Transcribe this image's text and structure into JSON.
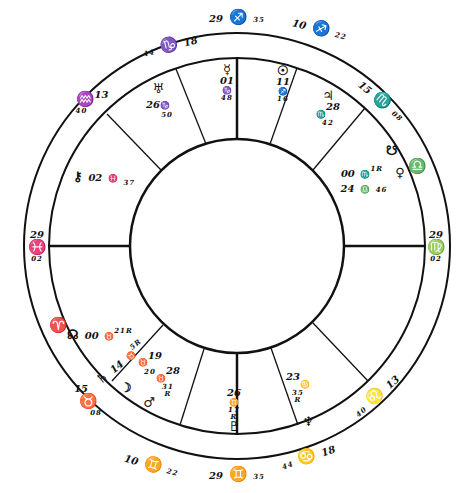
{
  "chart": {
    "type": "natal-wheel",
    "geometry": {
      "cx": 237,
      "cy": 246,
      "outer_r": 213,
      "ring_r": 188,
      "inner_r": 107
    },
    "colors": {
      "line": "#111111",
      "background": "#ffffff"
    }
  },
  "cusps": [
    {
      "id": "mc",
      "deg": "29",
      "sign": "♐",
      "min": "35",
      "x": 237,
      "y": 18
    },
    {
      "id": "c11",
      "deg": "10",
      "sign": "♐",
      "min": "22",
      "x": 322,
      "y": 30
    },
    {
      "id": "c12",
      "deg": "15",
      "sign": "♏",
      "min": "08",
      "x": 386,
      "y": 100
    },
    {
      "id": "asc_desc_right",
      "deg": "29",
      "sign": "♍",
      "min": "02",
      "x": 434,
      "y": 246
    },
    {
      "id": "c5",
      "deg": "13",
      "sign": "♌",
      "min": "40",
      "x": 383,
      "y": 395
    },
    {
      "id": "c4_right",
      "deg": "18",
      "sign": "♋",
      "min": "44",
      "x": 312,
      "y": 460
    },
    {
      "id": "ic",
      "deg": "29",
      "sign": "♊",
      "min": "35",
      "x": 237,
      "y": 474
    },
    {
      "id": "c3",
      "deg": "10",
      "sign": "♊",
      "min": "22",
      "x": 150,
      "y": 462
    },
    {
      "id": "c2",
      "deg": "15",
      "sign": "♉",
      "min": "08",
      "x": 95,
      "y": 400
    },
    {
      "id": "asc",
      "deg": "29",
      "sign": "♓",
      "min": "02",
      "x": 37,
      "y": 246
    },
    {
      "id": "c11_left",
      "deg": "13",
      "sign": "♒",
      "min": "40",
      "x": 90,
      "y": 102
    },
    {
      "id": "c10_left",
      "deg": "18",
      "sign": "♑",
      "min": "44",
      "x": 170,
      "y": 48
    }
  ],
  "signs_intercepted": [
    {
      "sign": "♎",
      "x": 417,
      "y": 166
    },
    {
      "sign": "♈",
      "x": 58,
      "y": 325
    }
  ],
  "planets": [
    {
      "name": "Mercury",
      "glyph": "☿",
      "text": [
        "01",
        "♑",
        "48"
      ],
      "x": 227,
      "y": 60
    },
    {
      "name": "Sun",
      "glyph": "☉",
      "text": [
        "11",
        "♐",
        "16"
      ],
      "x": 284,
      "y": 60
    },
    {
      "name": "Jupiter",
      "glyph": "♃",
      "text": [
        "28",
        "♏",
        "42"
      ],
      "x": 327,
      "y": 95
    },
    {
      "name": "Uranus",
      "glyph": "♅",
      "text": [
        "26",
        "♑",
        "50"
      ],
      "x": 157,
      "y": 85
    },
    {
      "name": "South Node",
      "glyph": "☋",
      "text": [],
      "x": 392,
      "y": 150
    },
    {
      "name": "Venus",
      "glyph": "♀",
      "text": [],
      "x": 400,
      "y": 170
    },
    {
      "name": "Mars",
      "glyph": "",
      "text": [
        "00",
        "♏",
        "1",
        "R"
      ],
      "x": 360,
      "y": 173
    },
    {
      "name": "Saturn-Libra",
      "glyph": "",
      "text": [
        "24",
        "♎",
        "46"
      ],
      "x": 362,
      "y": 188
    },
    {
      "name": "Chiron",
      "glyph": "⚷",
      "text": [
        "02",
        "♓",
        "37"
      ],
      "x": 100,
      "y": 175
    },
    {
      "name": "North Node",
      "glyph": "☊",
      "text": [
        "00",
        "♉",
        "21",
        "R"
      ],
      "x": 92,
      "y": 335
    },
    {
      "name": "Saturn",
      "glyph": "♄",
      "text": [
        "14",
        "♉",
        "5",
        "R"
      ],
      "x": 116,
      "y": 365
    },
    {
      "name": "Moon",
      "glyph": "☽",
      "text": [],
      "x": 126,
      "y": 387
    },
    {
      "name": "Pluto-like",
      "glyph": "♉",
      "text": [
        "19",
        "20"
      ],
      "x": 152,
      "y": 360
    },
    {
      "name": "Minor-28",
      "glyph": "♉",
      "text": [
        "28",
        "31",
        "R"
      ],
      "x": 167,
      "y": 378
    },
    {
      "name": "Mars2",
      "glyph": "♂",
      "text": [],
      "x": 149,
      "y": 400
    },
    {
      "name": "Pluto",
      "glyph": "♇",
      "text": [
        "26",
        "♊",
        "17",
        "R"
      ],
      "x": 234,
      "y": 410
    },
    {
      "name": "Moon-Cancer",
      "glyph": "♋",
      "text": [
        "23",
        "35",
        "R"
      ],
      "x": 296,
      "y": 385
    },
    {
      "name": "Neptune",
      "glyph": "♆",
      "text": [],
      "x": 307,
      "y": 420
    }
  ]
}
